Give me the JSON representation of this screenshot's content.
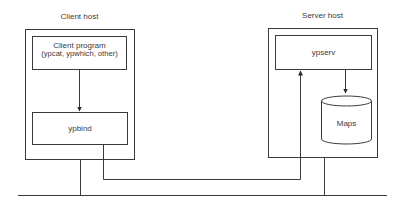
{
  "client_host": {
    "title": "Client host",
    "client_program": {
      "line1": "Client program",
      "line2": "(ypcat, ypwhich, other)"
    },
    "ypbind": "ypbind"
  },
  "server_host": {
    "title": "Server host",
    "ypserv": "ypserv",
    "maps": "Maps"
  },
  "colors": {
    "stroke": "#3a3a3a",
    "background": "#ffffff"
  }
}
